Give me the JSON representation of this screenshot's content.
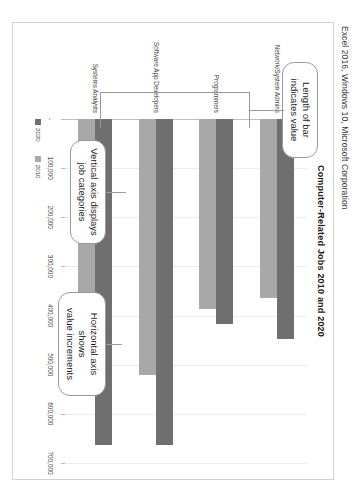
{
  "caption": "Excel 2016, Windows 10, Microsoft Corporation",
  "chart_data": {
    "type": "bar",
    "orientation": "horizontal",
    "title": "Computer-Related Jobs 2010 and 2020",
    "xlabel": "",
    "ylabel": "",
    "categories": [
      "Network/System Admins",
      "Programmers",
      "Software App Developers",
      "Systems Analysts"
    ],
    "series": [
      {
        "name": "2020",
        "color": "#6f6f6f",
        "values": [
          448000,
          417000,
          664000,
          664000
        ]
      },
      {
        "name": "2010",
        "color": "#a8a8a8",
        "values": [
          365000,
          387000,
          520000,
          546000
        ]
      }
    ],
    "xticks": [
      "-",
      "100,000",
      "200,000",
      "300,000",
      "400,000",
      "500,000",
      "600,000",
      "700,000"
    ],
    "xtick_values": [
      0,
      100000,
      200000,
      300000,
      400000,
      500000,
      600000,
      700000
    ],
    "xlim": [
      0,
      700000
    ],
    "grid": true,
    "legend_position": "bottom-left",
    "legend": [
      "2020",
      "2010"
    ]
  },
  "callouts": {
    "bar": "Length of bar\nindicates value",
    "bar_line1": "Length of bar",
    "bar_line2": "indicates value",
    "vertical_axis_line1": "Vertical axis displays",
    "vertical_axis_line2": "job categories",
    "horizontal_axis_line1": "Horizontal axis shows",
    "horizontal_axis_line2": "value increments"
  }
}
